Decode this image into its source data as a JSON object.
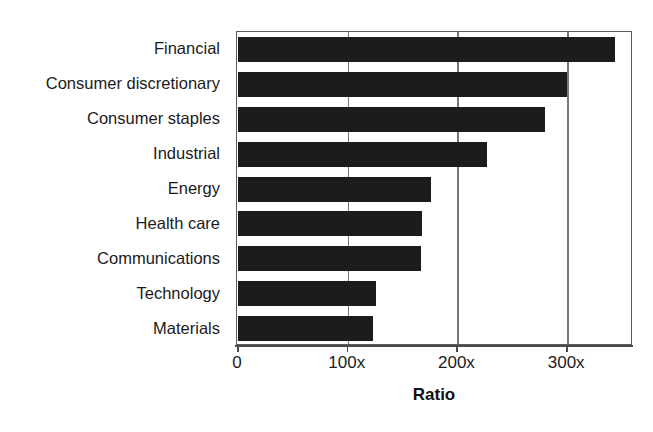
{
  "chart_data": {
    "type": "bar",
    "orientation": "horizontal",
    "title": "",
    "xlabel": "Ratio",
    "ylabel": "",
    "categories": [
      "Financial",
      "Consumer discretionary",
      "Consumer staples",
      "Industrial",
      "Energy",
      "Health care",
      "Communications",
      "Technology",
      "Materials"
    ],
    "values": [
      344,
      300,
      280,
      227,
      176,
      168,
      167,
      126,
      123
    ],
    "value_suffix": "x",
    "xlim": [
      0,
      360
    ],
    "xticks": [
      0,
      100,
      200,
      300
    ],
    "xtick_labels": [
      "0",
      "100x",
      "200x",
      "300x"
    ],
    "grid": true,
    "gridlines": "vertical",
    "legend": "none",
    "bar_color": "#1c1c1c",
    "frame_color": "#5c5c5c",
    "background": "#ffffff"
  }
}
